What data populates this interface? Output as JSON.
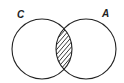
{
  "diagram": {
    "type": "venn",
    "sets": [
      {
        "id": "C",
        "label": "C"
      },
      {
        "id": "A",
        "label": "A"
      }
    ],
    "shaded_region": "C ∩ A",
    "shading_style": "diagonal-hatch",
    "colors": {
      "stroke": "#222222",
      "background": "#ffffff"
    }
  }
}
